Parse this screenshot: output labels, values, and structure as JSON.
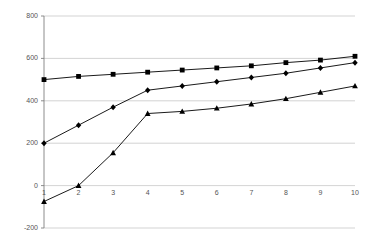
{
  "chart_data": {
    "type": "line",
    "title": "",
    "subtitle": "",
    "xlabel": "",
    "ylabel": "",
    "x": [
      1,
      2,
      3,
      4,
      5,
      6,
      7,
      8,
      9,
      10
    ],
    "categories": [
      "1",
      "2",
      "3",
      "4",
      "5",
      "6",
      "7",
      "8",
      "9",
      "10"
    ],
    "series": [
      {
        "name": "series-1",
        "marker": "square",
        "color": "#000000",
        "values": [
          500,
          515,
          525,
          535,
          545,
          555,
          565,
          580,
          592,
          610
        ]
      },
      {
        "name": "series-2",
        "marker": "diamond",
        "color": "#000000",
        "values": [
          200,
          285,
          370,
          450,
          470,
          490,
          510,
          530,
          555,
          580
        ]
      },
      {
        "name": "series-3",
        "marker": "triangle",
        "color": "#000000",
        "values": [
          -75,
          0,
          155,
          340,
          350,
          365,
          385,
          410,
          440,
          470
        ]
      }
    ],
    "ylim": [
      -200,
      800
    ],
    "xlim": [
      1,
      10
    ],
    "yticks": [
      -200,
      0,
      200,
      400,
      600,
      800
    ],
    "ytick_labels": [
      "-200",
      "0",
      "200",
      "400",
      "600",
      "800"
    ],
    "xtick_labels": [
      "1",
      "2",
      "3",
      "4",
      "5",
      "6",
      "7",
      "8",
      "9",
      "10"
    ],
    "grid": true,
    "grid_color": "#c8c8c8",
    "axis_color": "#808080",
    "legend": false,
    "legend_position": "none"
  }
}
